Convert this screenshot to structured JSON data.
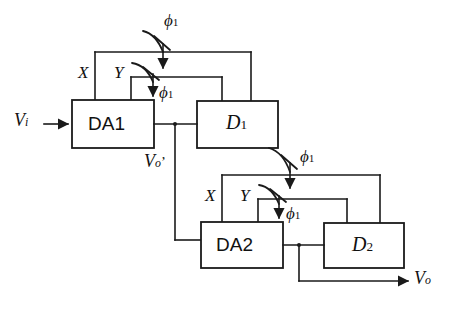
{
  "figure": {
    "type": "circuit-block-diagram",
    "width": 456,
    "height": 318,
    "background_color": "#ffffff",
    "line_color": "#1a1a1a"
  },
  "blocks": {
    "da1": {
      "label": "DA1"
    },
    "d1": {
      "label": "D",
      "subscript": "1"
    },
    "da2": {
      "label": "DA2"
    },
    "d2": {
      "label": "D",
      "subscript": "2"
    }
  },
  "signals": {
    "vin": {
      "label": "V",
      "subscript": "i"
    },
    "vout_prime": {
      "label": "V",
      "subscript": "o",
      "prime": "’"
    },
    "vout": {
      "label": "V",
      "subscript": "o"
    }
  },
  "port_labels": {
    "stage1_x": "X",
    "stage1_y": "Y",
    "stage2_x": "X",
    "stage2_y": "Y"
  },
  "clocks": {
    "phi_symbol": "ϕ",
    "phi_subscript": "1",
    "instances": [
      {
        "name": "stage1-outer-switch",
        "label": "ϕ1"
      },
      {
        "name": "stage1-inner-switch",
        "label": "ϕ1"
      },
      {
        "name": "stage2-outer-switch",
        "label": "ϕ1"
      },
      {
        "name": "stage2-inner-switch",
        "label": "ϕ1"
      }
    ]
  }
}
